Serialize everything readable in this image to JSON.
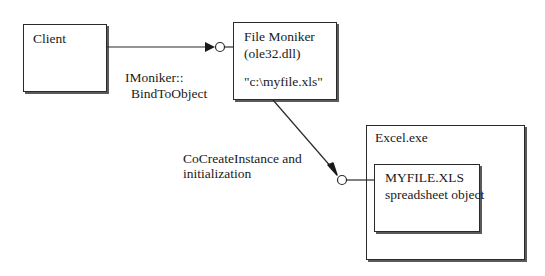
{
  "diagram": {
    "nodes": {
      "client": {
        "label": "Client"
      },
      "file_moniker": {
        "title": "File Moniker",
        "subtitle": "(ole32.dll)",
        "path": "\"c:\\myfile.xls\""
      },
      "excel": {
        "label": "Excel.exe",
        "inner": {
          "title": "MYFILE.XLS",
          "subtitle": "spreadsheet object"
        }
      }
    },
    "edges": [
      {
        "from": "client",
        "to": "file_moniker",
        "label_line1": "IMoniker::",
        "label_line2": "BindToObject"
      },
      {
        "from": "file_moniker",
        "to": "excel.inner",
        "label_line1": "CoCreateInstance and",
        "label_line2": "initialization"
      }
    ],
    "colors": {
      "stroke": "#2a2a2a",
      "shadow": "#5a5a5a",
      "background": "#ffffff"
    }
  }
}
